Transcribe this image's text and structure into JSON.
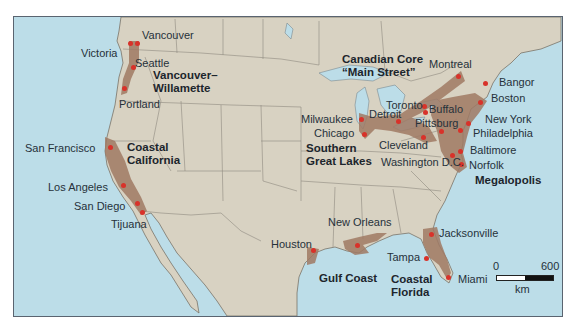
{
  "map": {
    "title": "",
    "colors": {
      "water": "#bcdde8",
      "land": "#d8d2c2",
      "border": "#8f8a80",
      "urban_region": "#a07a64",
      "city_dot": "#d8322a"
    },
    "cities": [
      {
        "name": "Victoria",
        "x": 80,
        "y": 46,
        "dot": [
          129,
          42
        ]
      },
      {
        "name": "Vancouver",
        "x": 141,
        "y": 28,
        "dot": [
          136,
          42
        ]
      },
      {
        "name": "Seattle",
        "x": 134,
        "y": 56,
        "dot": [
          132,
          66
        ]
      },
      {
        "name": "Portland",
        "x": 118,
        "y": 97,
        "dot": [
          123,
          87
        ]
      },
      {
        "name": "San Francisco",
        "x": 24,
        "y": 141,
        "dot": [
          109,
          146
        ]
      },
      {
        "name": "Los Angeles",
        "x": 47,
        "y": 180,
        "dot": [
          122,
          184
        ]
      },
      {
        "name": "San Diego",
        "x": 73,
        "y": 199,
        "dot": [
          136,
          202
        ]
      },
      {
        "name": "Tijuana",
        "x": 110,
        "y": 217,
        "dot": [
          141,
          211
        ]
      },
      {
        "name": "Montreal",
        "x": 428,
        "y": 57,
        "dot": [
          457,
          75
        ]
      },
      {
        "name": "Bangor",
        "x": 498,
        "y": 75,
        "dot": [
          484,
          82
        ]
      },
      {
        "name": "Boston",
        "x": 490,
        "y": 91,
        "dot": [
          479,
          101
        ]
      },
      {
        "name": "Toronto",
        "x": 385,
        "y": 98,
        "dot": [
          423,
          105
        ]
      },
      {
        "name": "Buffalo",
        "x": 428,
        "y": 102,
        "dot": [
          424,
          111
        ]
      },
      {
        "name": "Detroit",
        "x": 368,
        "y": 107,
        "dot": [
          397,
          120
        ]
      },
      {
        "name": "Milwaukee",
        "x": 300,
        "y": 112,
        "dot": [
          360,
          118
        ]
      },
      {
        "name": "Pittsburg",
        "x": 414,
        "y": 116,
        "dot": [
          440,
          130
        ]
      },
      {
        "name": "New York",
        "x": 484,
        "y": 112,
        "dot": [
          467,
          122
        ]
      },
      {
        "name": "Chicago",
        "x": 313,
        "y": 126,
        "dot": [
          363,
          133
        ]
      },
      {
        "name": "Philadelphia",
        "x": 472,
        "y": 126,
        "dot": [
          459,
          129
        ]
      },
      {
        "name": "Cleveland",
        "x": 378,
        "y": 138,
        "dot": [
          422,
          136
        ]
      },
      {
        "name": "Baltimore",
        "x": 469,
        "y": 143,
        "dot": [
          459,
          150
        ]
      },
      {
        "name": "Washington D.C.",
        "x": 380,
        "y": 155,
        "dot": [
          451,
          154
        ]
      },
      {
        "name": "Norfolk",
        "x": 468,
        "y": 158,
        "dot": [
          460,
          163
        ]
      },
      {
        "name": "Jacksonville",
        "x": 438,
        "y": 226,
        "dot": [
          430,
          233
        ]
      },
      {
        "name": "New Orleans",
        "x": 327,
        "y": 215,
        "dot": [
          356,
          244
        ]
      },
      {
        "name": "Houston",
        "x": 270,
        "y": 237,
        "dot": [
          312,
          249
        ]
      },
      {
        "name": "Tampa",
        "x": 386,
        "y": 250,
        "dot": [
          425,
          257
        ]
      },
      {
        "name": "Miami",
        "x": 457,
        "y": 272,
        "dot": [
          447,
          276
        ]
      }
    ],
    "regions": [
      {
        "name": "Vancouver–\nWillamette",
        "x": 152,
        "y": 68
      },
      {
        "name": "Coastal\nCalifornia",
        "x": 126,
        "y": 140
      },
      {
        "name": "Canadian Core\n“Main Street”",
        "x": 341,
        "y": 52
      },
      {
        "name": "Southern\nGreat Lakes",
        "x": 305,
        "y": 141
      },
      {
        "name": "Megalopolis",
        "x": 474,
        "y": 173
      },
      {
        "name": "Gulf Coast",
        "x": 318,
        "y": 271
      },
      {
        "name": "Coastal\nFlorida",
        "x": 390,
        "y": 272
      }
    ],
    "scale_bar": {
      "min_label": "0",
      "max_label": "600",
      "unit": "km"
    }
  }
}
